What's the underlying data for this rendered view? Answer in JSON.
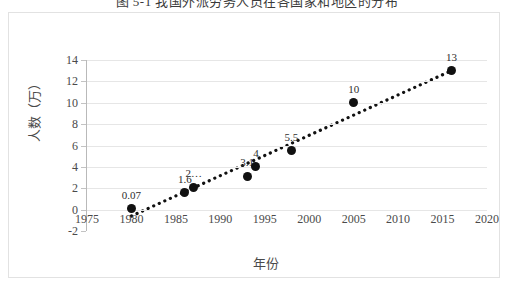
{
  "caption": "图 5-1 我国外派劳务人员在各国家和地区的分布",
  "chart_data": {
    "type": "scatter",
    "title": "",
    "xlabel": "年份",
    "ylabel": "人数（万）",
    "xlim": [
      1975,
      2020
    ],
    "ylim": [
      -2,
      14
    ],
    "xticks": [
      "1975",
      "1980",
      "1985",
      "1990",
      "1995",
      "2000",
      "2005",
      "2010",
      "2015",
      "2020"
    ],
    "xtick_values": [
      1975,
      1980,
      1985,
      1990,
      1995,
      2000,
      2005,
      2010,
      2015,
      2020
    ],
    "yticks": [
      "-2",
      "0",
      "2",
      "4",
      "6",
      "8",
      "10",
      "12",
      "14"
    ],
    "ytick_values": [
      -2,
      0,
      2,
      4,
      6,
      8,
      10,
      12,
      14
    ],
    "grid": "horizontal",
    "legend": "none",
    "marker_color": "#111111",
    "trendline": {
      "style": "dotted",
      "color": "#111111",
      "x_start": 1980,
      "y_start": -0.6,
      "x_end": 2016,
      "y_end": 13.0
    },
    "points": [
      {
        "x": 1980,
        "y": 0.07,
        "label": "0.07"
      },
      {
        "x": 1986,
        "y": 1.6,
        "label": "1.6"
      },
      {
        "x": 1987,
        "y": 2.1,
        "label": "2…"
      },
      {
        "x": 1993,
        "y": 3.1,
        "label": "3.1"
      },
      {
        "x": 1994,
        "y": 4.0,
        "label": "4"
      },
      {
        "x": 1998,
        "y": 5.5,
        "label": "5.5"
      },
      {
        "x": 2005,
        "y": 10.0,
        "label": "10"
      },
      {
        "x": 2016,
        "y": 13.0,
        "label": "13"
      }
    ]
  }
}
